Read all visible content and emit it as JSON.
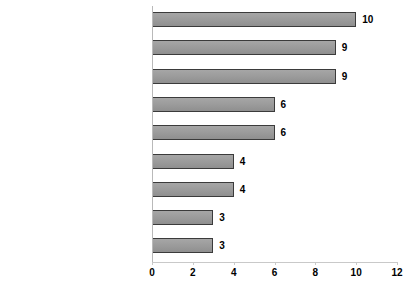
{
  "chart_data": {
    "type": "bar",
    "orientation": "horizontal",
    "title": "",
    "xlabel": "",
    "ylabel": "",
    "xlim": [
      0,
      12
    ],
    "xticks": [
      0,
      2,
      4,
      6,
      8,
      10,
      12
    ],
    "grid": false,
    "legend": false,
    "bar_color": "#9e9e9e",
    "bar_border_color": "#3b3b3b",
    "axis_color": "#c9c9c9",
    "categories": [
      "Exclusiveness of Christianity",
      "Hypocrisy of Christians",
      "Ethical disgreements",
      "Lifestyle choices",
      "Unsatisfactory answers",
      "Unanswered questions",
      "Negative role models",
      "Moving from community",
      "Unreal relationship with God"
    ],
    "values": [
      10,
      9,
      9,
      6,
      6,
      4,
      4,
      3,
      3
    ],
    "data_labels": [
      "10",
      "9",
      "9",
      "6",
      "6",
      "4",
      "4",
      "3",
      "3"
    ]
  }
}
